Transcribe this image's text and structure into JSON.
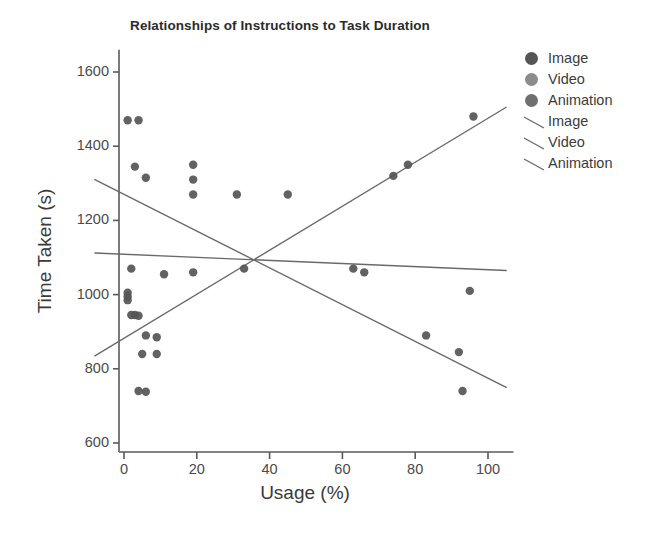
{
  "chart_data": {
    "type": "scatter",
    "title": "Relationships of Instructions to Task Duration",
    "xlabel": "Usage (%)",
    "ylabel": "Time Taken (s)",
    "xlim": [
      -8,
      107
    ],
    "ylim": [
      540,
      1660
    ],
    "xticks": [
      0,
      20,
      40,
      60,
      80,
      100
    ],
    "yticks": [
      600,
      800,
      1000,
      1200,
      1400,
      1600
    ],
    "grid": false,
    "legend_position": "outside-right-top",
    "legend": [
      {
        "label": "Image",
        "kind": "marker",
        "color": "#555555"
      },
      {
        "label": "Video",
        "kind": "marker",
        "color": "#8c8c8c"
      },
      {
        "label": "Animation",
        "kind": "marker",
        "color": "#6f6f6f"
      },
      {
        "label": "Image",
        "kind": "line",
        "color": "#6a6a6a"
      },
      {
        "label": "Video",
        "kind": "line",
        "color": "#6a6a6a"
      },
      {
        "label": "Animation",
        "kind": "line",
        "color": "#6a6a6a"
      }
    ],
    "series": [
      {
        "name": "Image",
        "kind": "marker",
        "color": "#555555",
        "points": [
          [
            1,
            1470
          ],
          [
            4,
            1470
          ],
          [
            3,
            1345
          ],
          [
            6,
            1315
          ],
          [
            19,
            1350
          ],
          [
            19,
            1310
          ],
          [
            19,
            1270
          ],
          [
            31,
            1270
          ],
          [
            45,
            1270
          ],
          [
            2,
            1070
          ],
          [
            11,
            1055
          ],
          [
            19,
            1060
          ],
          [
            74,
            1320
          ],
          [
            78,
            1350
          ],
          [
            96,
            1480
          ],
          [
            1,
            1005
          ],
          [
            1,
            995
          ],
          [
            1,
            985
          ],
          [
            2,
            945
          ],
          [
            3,
            945
          ],
          [
            4,
            943
          ],
          [
            6,
            890
          ],
          [
            9,
            885
          ],
          [
            5,
            840
          ],
          [
            9,
            840
          ],
          [
            33,
            1070
          ],
          [
            63,
            1070
          ],
          [
            66,
            1060
          ],
          [
            95,
            1010
          ],
          [
            83,
            890
          ],
          [
            92,
            845
          ],
          [
            93,
            740
          ],
          [
            4,
            740
          ],
          [
            6,
            738
          ]
        ]
      },
      {
        "name": "Video",
        "kind": "marker",
        "color": "#8c8c8c",
        "points": []
      },
      {
        "name": "Animation",
        "kind": "marker",
        "color": "#6f6f6f",
        "points": []
      },
      {
        "name": "Image",
        "kind": "line",
        "color": "#6a6a6a",
        "trend": "descending",
        "endpoints": [
          [
            -8,
            1310
          ],
          [
            105,
            750
          ]
        ]
      },
      {
        "name": "Video",
        "kind": "line",
        "color": "#6a6a6a",
        "trend": "flat",
        "endpoints": [
          [
            -8,
            1112
          ],
          [
            105,
            1065
          ]
        ]
      },
      {
        "name": "Animation",
        "kind": "line",
        "color": "#6a6a6a",
        "trend": "ascending",
        "endpoints": [
          [
            -8,
            835
          ],
          [
            105,
            1505
          ]
        ]
      }
    ],
    "intersection": [
      37,
      1090
    ]
  },
  "axes": {
    "x_tick_labels": [
      "0",
      "20",
      "40",
      "60",
      "80",
      "100"
    ],
    "y_tick_labels": [
      "600",
      "800",
      "1000",
      "1200",
      "1400",
      "1600"
    ]
  }
}
